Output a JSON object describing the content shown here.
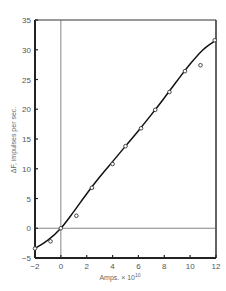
{
  "chart_data": {
    "type": "scatter",
    "title": "",
    "xlabel": "Amps. × 10",
    "xlabel_exponent": "10",
    "ylabel": "ΔF, impulses per sec.",
    "xlim": [
      -2,
      12
    ],
    "ylim": [
      -5,
      35
    ],
    "xticks": [
      -2,
      0,
      2,
      4,
      6,
      8,
      10,
      12
    ],
    "yticks": [
      -5,
      0,
      5,
      10,
      15,
      20,
      25,
      30,
      35
    ],
    "grid": false,
    "reference_lines": {
      "x": 0,
      "y": 0
    },
    "series": [
      {
        "name": "measured",
        "marker": "open-circle",
        "x": [
          -2.0,
          -0.8,
          0.0,
          1.2,
          2.4,
          4.0,
          5.0,
          6.2,
          7.3,
          8.4,
          9.6,
          10.8,
          11.9
        ],
        "y": [
          -3.4,
          -2.2,
          0.0,
          2.1,
          6.8,
          10.8,
          13.8,
          16.8,
          19.9,
          22.9,
          26.4,
          27.4,
          31.6
        ]
      },
      {
        "name": "fitted curve",
        "marker": "none",
        "x": [
          -2.0,
          -1.0,
          0.0,
          1.0,
          2.0,
          3.0,
          4.0,
          5.0,
          6.0,
          7.0,
          8.0,
          9.0,
          10.0,
          11.0,
          12.0
        ],
        "y": [
          -3.4,
          -2.0,
          0.0,
          2.8,
          5.8,
          8.6,
          11.2,
          13.8,
          16.4,
          19.1,
          21.9,
          24.8,
          27.6,
          30.0,
          31.6
        ]
      }
    ]
  }
}
